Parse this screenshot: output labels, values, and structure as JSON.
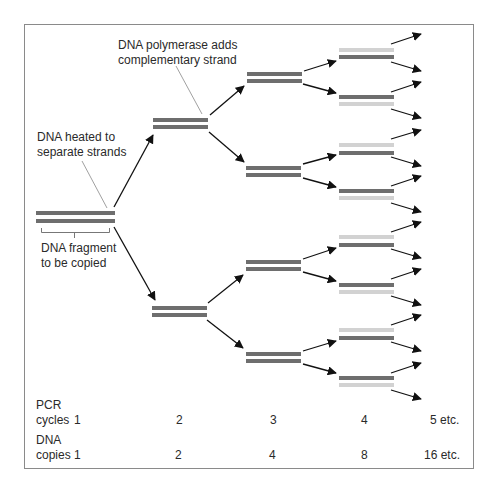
{
  "annotations": {
    "polymerase": [
      "DNA polymerase adds",
      "complementary strand"
    ],
    "heated": [
      "DNA heated to",
      "separate strands"
    ],
    "fragment": [
      "DNA fragment",
      "to be copied"
    ]
  },
  "rows": {
    "cycles": {
      "label_line1": "PCR",
      "label_line2": "cycles",
      "values": [
        "1",
        "2",
        "3",
        "4",
        "5 etc."
      ]
    },
    "copies": {
      "label_line1": "DNA",
      "label_line2": "copies",
      "values": [
        "1",
        "2",
        "4",
        "8",
        "16 etc."
      ]
    }
  },
  "colors": {
    "dark_strand": "#6e6e6e",
    "light_strand": "#d2d2d2",
    "arrow": "#111111",
    "leader_line": "#777777",
    "frame": "#8a8a8a"
  }
}
